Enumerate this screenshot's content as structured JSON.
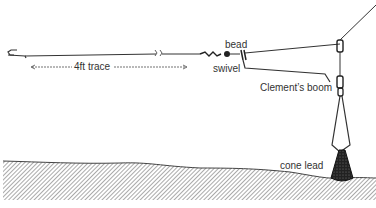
{
  "diagram": {
    "type": "fishing-rig-illustration",
    "labels": {
      "trace": "4ft trace",
      "bead": "bead",
      "swivel": "swivel",
      "boom": "Clement’s boom",
      "lead": "cone lead"
    },
    "components": [
      "hook",
      "4ft trace",
      "swivel",
      "bead",
      "Clement's boom",
      "cone lead",
      "main line",
      "seabed"
    ],
    "colors": {
      "line": "#333333",
      "seabed_hatch": "#555555",
      "lead": "#222222",
      "text": "#333333"
    }
  }
}
